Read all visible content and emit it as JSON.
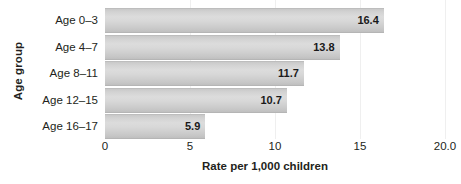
{
  "chart_data": {
    "type": "bar",
    "orientation": "horizontal",
    "title": "",
    "xlabel": "Rate per 1,000 children",
    "ylabel": "Age group",
    "categories": [
      "Age 0–3",
      "Age 4–7",
      "Age 8–11",
      "Age 12–15",
      "Age 16–17"
    ],
    "values": [
      16.4,
      13.8,
      11.7,
      10.7,
      5.9
    ],
    "value_labels": [
      "16.4",
      "13.8",
      "11.7",
      "10.7",
      "5.9"
    ],
    "xlim": [
      0,
      20
    ],
    "xticks": [
      0,
      5,
      10,
      15,
      20
    ],
    "xtick_labels": [
      "0",
      "5",
      "10",
      "15",
      "20.0"
    ],
    "grid": "vertical",
    "legend": "none",
    "bar_color": "#d2d2d2",
    "text_color": "#231f20",
    "gridline_color": "#efefef",
    "background": "#ffffff"
  }
}
